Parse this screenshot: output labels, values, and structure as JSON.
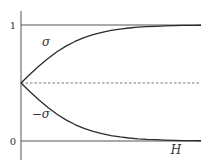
{
  "chart_data": {
    "type": "line",
    "title": "",
    "xlabel": "H",
    "ylabel": "",
    "xlim": [
      0,
      10
    ],
    "ylim": [
      -0.15,
      1.15
    ],
    "yticks": [
      {
        "value": 0,
        "label": "0"
      },
      {
        "value": 1,
        "label": "1"
      }
    ],
    "grid": false,
    "reference_lines": [
      {
        "name": "upper-limit",
        "y": 1,
        "style": "solid"
      },
      {
        "name": "lower-limit",
        "y": 0,
        "style": "solid"
      },
      {
        "name": "midline",
        "y": 0.5,
        "style": "dashed"
      }
    ],
    "x": [
      0,
      0.5,
      1,
      1.5,
      2,
      2.5,
      3,
      3.5,
      4,
      4.5,
      5,
      5.5,
      6,
      6.5,
      7,
      7.5,
      8,
      8.5,
      9,
      9.5,
      10
    ],
    "series": [
      {
        "name": "σ",
        "values": [
          0.5,
          0.575,
          0.646,
          0.711,
          0.769,
          0.818,
          0.858,
          0.891,
          0.917,
          0.937,
          0.953,
          0.965,
          0.974,
          0.981,
          0.986,
          0.989,
          0.992,
          0.994,
          0.996,
          0.997,
          0.998
        ]
      },
      {
        "name": "−σ",
        "values": [
          0.5,
          0.425,
          0.354,
          0.289,
          0.231,
          0.182,
          0.142,
          0.109,
          0.083,
          0.063,
          0.047,
          0.035,
          0.026,
          0.019,
          0.014,
          0.011,
          0.008,
          0.006,
          0.004,
          0.003,
          0.002
        ]
      }
    ],
    "annotations": [
      {
        "text": "σ",
        "near_series": "σ",
        "x": 1.4,
        "y": 0.85
      },
      {
        "text": "−σ",
        "near_series": "−σ",
        "x": 1.1,
        "y": 0.23
      }
    ],
    "legend": "none"
  },
  "colors": {
    "line": "#2b2b2b",
    "axis": "#555555",
    "reference": "#555555",
    "text": "#333333"
  }
}
